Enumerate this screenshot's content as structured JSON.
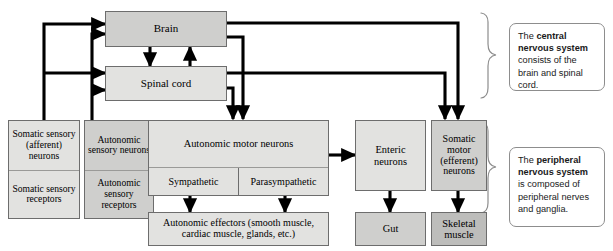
{
  "diagram": {
    "cns": {
      "brain": "Brain",
      "spinal_cord": "Spinal cord"
    },
    "afferent": {
      "somatic_neurons": "Somatic sensory (afferent) neurons",
      "somatic_receptors": "Somatic sensory receptors",
      "autonomic_neurons": "Autonomic sensory neurons",
      "autonomic_receptors": "Autonomic sensory receptors"
    },
    "efferent": {
      "autonomic_motor": "Autonomic motor neurons",
      "sympathetic": "Sympathetic",
      "parasympathetic": "Parasympathetic",
      "autonomic_effectors": "Autonomic effectors (smooth muscle, cardiac muscle, glands, etc.)",
      "enteric": "Enteric neurons",
      "gut": "Gut",
      "somatic_motor": "Somatic motor (efferent) neurons",
      "skeletal_muscle": "Skeletal muscle"
    },
    "callouts": {
      "cns": {
        "lead": "The ",
        "bold": "central nervous system",
        "tail": " consists of the brain and spinal cord."
      },
      "pns": {
        "lead": "The ",
        "bold": "peripheral nervous system",
        "tail": " is composed of peripheral nerves and ganglia."
      }
    },
    "colors": {
      "light_gray": "#e2e2e0",
      "mid_gray": "#cfcfcd",
      "dark_gray": "#bdbdbb",
      "line": "#000000",
      "border": "#6d6d6d"
    }
  }
}
